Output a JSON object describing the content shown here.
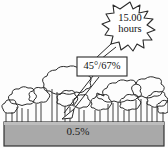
{
  "diagram": {
    "sun": {
      "icon": "sun-burst-icon",
      "value_line1": "15.00",
      "value_line2": "hours",
      "full_label": "15.00 hours"
    },
    "ray": {
      "icon": "light-ray-arrow-icon",
      "callout": {
        "label": "45°/67%",
        "angle": "45°",
        "percent": "67%"
      }
    },
    "canopy": {
      "icon": "tree-canopy-icon",
      "left_stand_trees": 9,
      "right_stand_trees": 12
    },
    "ground": {
      "label": "0.5%",
      "fill_color": "#a9a9a9",
      "border_color": "#333333"
    },
    "colors": {
      "background": "#fdfdfd",
      "ink": "#2b2b2b",
      "ground_fill": "#a9a9a9",
      "box_fill": "#ffffff"
    }
  }
}
